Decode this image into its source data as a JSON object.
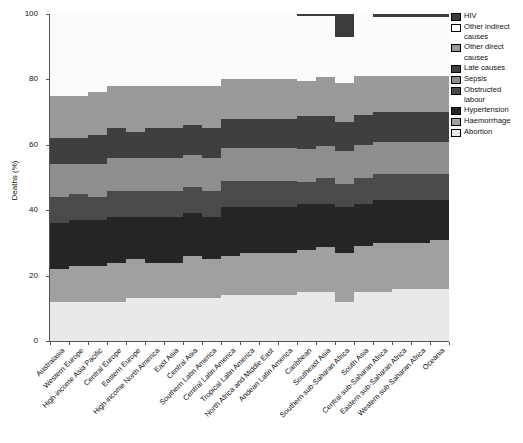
{
  "chart": {
    "ylabel": "Deaths (%)",
    "yticks": [
      0,
      20,
      40,
      60,
      80,
      100
    ],
    "ylim": [
      0,
      100
    ]
  },
  "legend": {
    "items": [
      {
        "label": "HIV",
        "color": "#3b3b3b"
      },
      {
        "label": "Other indirect causes",
        "color": "#fbfbfb"
      },
      {
        "label": "Other direct causes",
        "color": "#9a9a9a"
      },
      {
        "label": "Late causes",
        "color": "#3f3f3f"
      },
      {
        "label": "Sepsis",
        "color": "#8e8e8e"
      },
      {
        "label": "Obstructed labour",
        "color": "#4a4a4a"
      },
      {
        "label": "Hypertension",
        "color": "#252525"
      },
      {
        "label": "Haemorrhage",
        "color": "#a0a0a0"
      },
      {
        "label": "Abortion",
        "color": "#e9e9e9"
      }
    ]
  },
  "chart_data": {
    "type": "area",
    "title": "",
    "xlabel": "",
    "ylabel": "Deaths (%)",
    "ylim": [
      0,
      100
    ],
    "grid": false,
    "legend_position": "right",
    "stacked": true,
    "stack_order_bottom_to_top": [
      "Abortion",
      "Haemorrhage",
      "Hypertension",
      "Obstructed labour",
      "Sepsis",
      "Late causes",
      "Other direct causes",
      "Other indirect causes",
      "HIV"
    ],
    "categories": [
      "Australasia",
      "Western Europe",
      "High-income Asia Pacific",
      "Central Europe",
      "Eastern Europe",
      "High-income North America",
      "East Asia",
      "Central Asia",
      "Southern Latin America",
      "Central Latin America",
      "Tropical Latin America",
      "North Africa and Middle East",
      "Andean Latin America",
      "Caribbean",
      "Southeast Asia",
      "Southern sub-Saharan Africa",
      "South Asia",
      "Central sub-Saharan Africa",
      "Eastern sub-Saharan Africa",
      "Western sub-Saharan Africa",
      "Oceania"
    ],
    "series": [
      {
        "name": "Abortion",
        "values": [
          12,
          12,
          12,
          12,
          13,
          13,
          13,
          13,
          13,
          14,
          14,
          14,
          14,
          15,
          15,
          12,
          15,
          15,
          16,
          16,
          16
        ]
      },
      {
        "name": "Haemorrhage",
        "values": [
          10,
          11,
          11,
          12,
          12,
          11,
          11,
          13,
          12,
          12,
          13,
          13,
          13,
          13,
          14,
          15,
          14,
          15,
          14,
          14,
          15
        ]
      },
      {
        "name": "Hypertension",
        "values": [
          14,
          14,
          14,
          14,
          13,
          14,
          14,
          13,
          13,
          15,
          14,
          14,
          14,
          14,
          13,
          14,
          13,
          13,
          13,
          13,
          12
        ]
      },
      {
        "name": "Obstructed labour",
        "values": [
          8,
          8,
          7,
          8,
          8,
          8,
          8,
          8,
          8,
          8,
          8,
          8,
          8,
          7,
          8,
          7,
          8,
          8,
          8,
          8,
          8
        ]
      },
      {
        "name": "Sepsis",
        "values": [
          10,
          9,
          10,
          10,
          10,
          10,
          10,
          10,
          10,
          10,
          10,
          10,
          10,
          10,
          10,
          10,
          10,
          10,
          10,
          10,
          10
        ]
      },
      {
        "name": "Late causes",
        "values": [
          8,
          8,
          9,
          9,
          8,
          9,
          9,
          9,
          9,
          9,
          9,
          9,
          9,
          10,
          9,
          9,
          9,
          9,
          9,
          9,
          9
        ]
      },
      {
        "name": "Other direct causes",
        "values": [
          13,
          13,
          13,
          13,
          14,
          13,
          13,
          12,
          13,
          12,
          12,
          12,
          12,
          11,
          12,
          12,
          12,
          11,
          11,
          11,
          11
        ]
      },
      {
        "name": "Other indirect causes",
        "values": [
          25,
          25,
          24,
          22,
          22,
          22,
          22,
          22,
          22,
          20,
          20,
          20,
          20,
          20,
          19,
          14,
          19,
          18,
          18,
          18,
          18
        ]
      },
      {
        "name": "HIV",
        "values": [
          0,
          0,
          0,
          0,
          0,
          0,
          0,
          0,
          0,
          0,
          0,
          0,
          0,
          0.5,
          0.5,
          7,
          0,
          1,
          1,
          1,
          1
        ]
      }
    ]
  }
}
